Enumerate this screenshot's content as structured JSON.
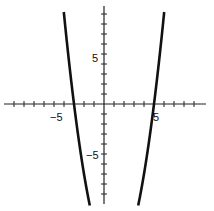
{
  "chart_data": {
    "type": "line",
    "title": "",
    "xlabel": "",
    "ylabel": "",
    "function": "y = (x + 3)(x - 5) = x^2 - 2x - 15",
    "roots": [
      -3,
      5
    ],
    "xlim": [
      -10,
      10
    ],
    "ylim": [
      -10,
      10
    ],
    "x_tick_step": 1,
    "y_tick_step": 1,
    "x_tick_labels": [
      {
        "value": -5,
        "label": "-5"
      },
      {
        "value": 5,
        "label": "5"
      }
    ],
    "y_tick_labels": [
      {
        "value": 5,
        "label": "5"
      },
      {
        "value": -5,
        "label": "-5"
      }
    ],
    "grid": false,
    "series": [
      {
        "name": "parabola",
        "color": "#111111",
        "coef": [
          1,
          -2,
          -15
        ]
      }
    ]
  },
  "labels": {
    "xneg5": "−5",
    "xpos5": "5",
    "ypos5": "5",
    "yneg5": "−5"
  }
}
